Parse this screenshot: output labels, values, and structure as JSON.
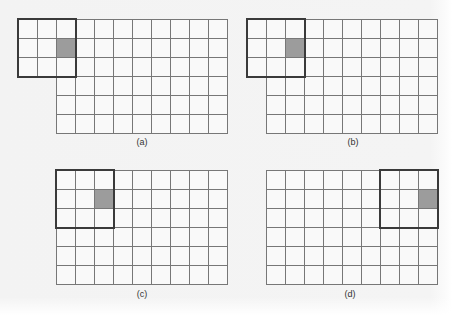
{
  "figure": {
    "cell_size_px": 19,
    "grid_cols": 9,
    "grid_rows": 6,
    "window_size": 3,
    "colors": {
      "background": "#f4f4f4",
      "grid_line": "#777777",
      "window_border": "#3a3a3a",
      "shaded_cell": "#9c9c9c"
    },
    "panels": [
      {
        "label": "(a)",
        "grid_origin": [
          56,
          19
        ],
        "window_col": -2,
        "window_row": 0,
        "shaded_col": 0,
        "shaded_row": 1,
        "label_pos": [
          142,
          137
        ]
      },
      {
        "label": "(b)",
        "grid_origin": [
          266,
          19
        ],
        "window_col": -1,
        "window_row": 0,
        "shaded_col": 1,
        "shaded_row": 1,
        "label_pos": [
          353,
          137
        ]
      },
      {
        "label": "(c)",
        "grid_origin": [
          56,
          170
        ],
        "window_col": 0,
        "window_row": 0,
        "shaded_col": 2,
        "shaded_row": 1,
        "label_pos": [
          142,
          289
        ]
      },
      {
        "label": "(d)",
        "grid_origin": [
          266,
          170
        ],
        "window_col": 6,
        "window_row": 0,
        "shaded_col": 8,
        "shaded_row": 1,
        "label_pos": [
          350,
          289
        ]
      }
    ]
  }
}
